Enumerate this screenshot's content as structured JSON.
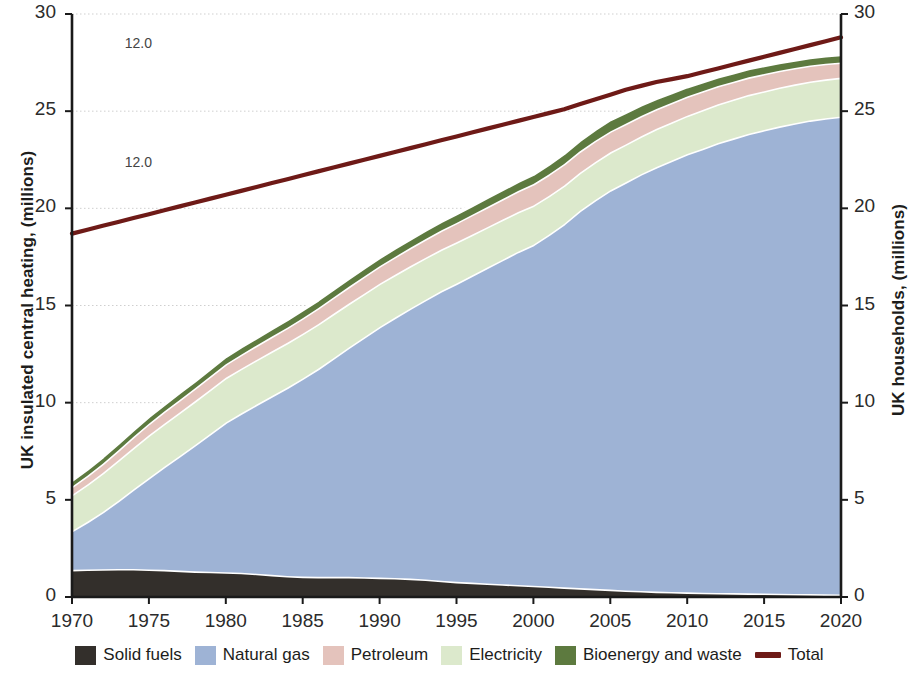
{
  "axes": {
    "ylabel_left": "UK insulated central heating, (millions)",
    "ylabel_right": "UK households, (millions)",
    "yticks": [
      "0",
      "5",
      "10",
      "15",
      "20",
      "25",
      "30"
    ],
    "xticks": [
      "1970",
      "1975",
      "1980",
      "1985",
      "1990",
      "1995",
      "2000",
      "2005",
      "2010",
      "2015",
      "2020"
    ]
  },
  "annotations": [
    {
      "text": "12.0",
      "x": 1972.0,
      "y": 28.4
    },
    {
      "text": "12.0",
      "x": 1972.0,
      "y": 22.3
    }
  ],
  "legend": {
    "items": [
      {
        "label": "Solid fuels",
        "color": "#332f2b",
        "type": "area"
      },
      {
        "label": "Natural gas",
        "color": "#9eb3d5",
        "type": "area"
      },
      {
        "label": "Petroleum",
        "color": "#e4c3bc",
        "type": "area"
      },
      {
        "label": "Electricity",
        "color": "#dce9cc",
        "type": "area"
      },
      {
        "label": "Bioenergy and waste",
        "color": "#5d7a3f",
        "type": "area"
      },
      {
        "label": "Total",
        "color": "#6e1a17",
        "type": "line"
      }
    ]
  },
  "chart_data": {
    "type": "area",
    "title": "",
    "subtitle": "",
    "xlabel": "",
    "ylabel": "UK insulated central heating, (millions)",
    "ylabel_secondary": "UK households, (millions)",
    "xlim": [
      1970,
      2020
    ],
    "ylim": [
      0,
      30
    ],
    "ylim_secondary": [
      0,
      30
    ],
    "grid": true,
    "grid_axis": "y",
    "legend_position": "bottom",
    "stacked": true,
    "stack_order_bottom_to_top": [
      "Solid fuels",
      "Natural gas",
      "Electricity",
      "Petroleum",
      "Bioenergy and waste"
    ],
    "x": [
      1970,
      1971,
      1972,
      1973,
      1974,
      1975,
      1976,
      1977,
      1978,
      1979,
      1980,
      1981,
      1982,
      1983,
      1984,
      1985,
      1986,
      1987,
      1988,
      1989,
      1990,
      1991,
      1992,
      1993,
      1994,
      1995,
      1996,
      1997,
      1998,
      1999,
      2000,
      2001,
      2002,
      2003,
      2004,
      2005,
      2006,
      2007,
      2008,
      2009,
      2010,
      2011,
      2012,
      2013,
      2014,
      2015,
      2016,
      2017,
      2018,
      2019,
      2020
    ],
    "series": [
      {
        "name": "Solid fuels",
        "color": "#332f2b",
        "values": [
          1.4,
          1.42,
          1.43,
          1.44,
          1.44,
          1.42,
          1.4,
          1.36,
          1.32,
          1.3,
          1.28,
          1.25,
          1.2,
          1.14,
          1.08,
          1.05,
          1.04,
          1.04,
          1.04,
          1.02,
          1.0,
          0.98,
          0.95,
          0.9,
          0.84,
          0.78,
          0.74,
          0.7,
          0.66,
          0.62,
          0.58,
          0.54,
          0.5,
          0.46,
          0.42,
          0.38,
          0.34,
          0.31,
          0.28,
          0.26,
          0.24,
          0.22,
          0.21,
          0.2,
          0.19,
          0.18,
          0.17,
          0.16,
          0.15,
          0.14,
          0.13
        ]
      },
      {
        "name": "Natural gas",
        "color": "#9eb3d5",
        "values": [
          2.0,
          2.45,
          2.95,
          3.5,
          4.1,
          4.7,
          5.3,
          5.9,
          6.5,
          7.1,
          7.7,
          8.2,
          8.7,
          9.2,
          9.7,
          10.2,
          10.7,
          11.25,
          11.8,
          12.35,
          12.9,
          13.4,
          13.9,
          14.4,
          14.9,
          15.35,
          15.8,
          16.25,
          16.7,
          17.15,
          17.55,
          18.1,
          18.7,
          19.4,
          20.0,
          20.55,
          21.0,
          21.45,
          21.85,
          22.2,
          22.55,
          22.85,
          23.15,
          23.4,
          23.65,
          23.85,
          24.05,
          24.22,
          24.38,
          24.5,
          24.6
        ]
      },
      {
        "name": "Electricity",
        "color": "#dce9cc",
        "values": [
          1.85,
          1.92,
          2.0,
          2.08,
          2.14,
          2.2,
          2.22,
          2.24,
          2.26,
          2.28,
          2.3,
          2.3,
          2.3,
          2.3,
          2.3,
          2.3,
          2.3,
          2.28,
          2.26,
          2.24,
          2.22,
          2.2,
          2.18,
          2.16,
          2.14,
          2.12,
          2.1,
          2.08,
          2.06,
          2.04,
          2.02,
          2.0,
          1.98,
          1.96,
          1.95,
          1.95,
          1.95,
          1.95,
          1.96,
          1.97,
          1.98,
          1.99,
          2.0,
          2.0,
          2.0,
          2.0,
          2.0,
          2.0,
          2.0,
          2.0,
          2.0
        ]
      },
      {
        "name": "Petroleum",
        "color": "#e4c3bc",
        "values": [
          0.42,
          0.45,
          0.48,
          0.52,
          0.56,
          0.6,
          0.62,
          0.64,
          0.66,
          0.68,
          0.7,
          0.72,
          0.74,
          0.76,
          0.78,
          0.8,
          0.82,
          0.84,
          0.86,
          0.88,
          0.9,
          0.92,
          0.94,
          0.96,
          0.98,
          1.0,
          1.02,
          1.04,
          1.06,
          1.08,
          1.1,
          1.1,
          1.1,
          1.1,
          1.1,
          1.08,
          1.06,
          1.04,
          1.02,
          1.0,
          0.98,
          0.96,
          0.94,
          0.92,
          0.9,
          0.88,
          0.86,
          0.84,
          0.82,
          0.8,
          0.78
        ]
      },
      {
        "name": "Bioenergy and waste",
        "color": "#5d7a3f",
        "values": [
          0.33,
          0.34,
          0.35,
          0.36,
          0.36,
          0.37,
          0.37,
          0.38,
          0.38,
          0.39,
          0.39,
          0.4,
          0.4,
          0.41,
          0.41,
          0.42,
          0.42,
          0.43,
          0.43,
          0.44,
          0.44,
          0.45,
          0.45,
          0.46,
          0.46,
          0.47,
          0.47,
          0.48,
          0.48,
          0.49,
          0.5,
          0.52,
          0.54,
          0.56,
          0.58,
          0.6,
          0.58,
          0.56,
          0.54,
          0.52,
          0.5,
          0.48,
          0.46,
          0.45,
          0.44,
          0.43,
          0.42,
          0.41,
          0.4,
          0.4,
          0.4
        ]
      }
    ],
    "overlay_line": {
      "name": "Total",
      "color": "#6e1a17",
      "axis": "secondary",
      "values": [
        18.7,
        18.9,
        19.1,
        19.3,
        19.5,
        19.7,
        19.9,
        20.1,
        20.3,
        20.5,
        20.7,
        20.9,
        21.1,
        21.3,
        21.5,
        21.7,
        21.9,
        22.1,
        22.3,
        22.5,
        22.7,
        22.9,
        23.1,
        23.3,
        23.5,
        23.7,
        23.9,
        24.1,
        24.3,
        24.5,
        24.7,
        24.9,
        25.1,
        25.35,
        25.6,
        25.85,
        26.1,
        26.3,
        26.5,
        26.65,
        26.8,
        27.0,
        27.2,
        27.4,
        27.6,
        27.8,
        28.0,
        28.2,
        28.4,
        28.6,
        28.8
      ]
    }
  }
}
